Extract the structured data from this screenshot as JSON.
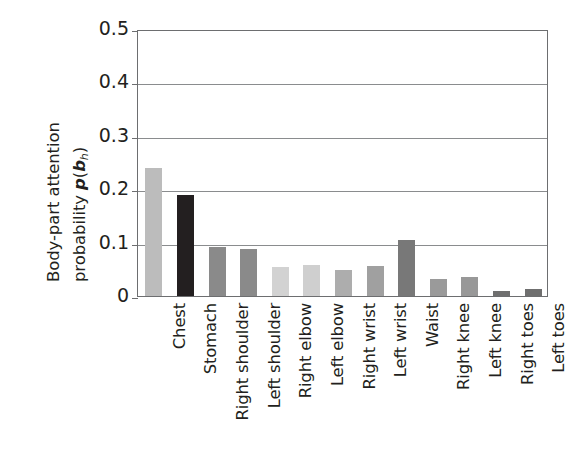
{
  "chart_data": {
    "type": "bar",
    "title": "",
    "xlabel": "",
    "ylabel_line1": "Body-part attention",
    "ylabel_line2_prefix": "probability ",
    "ylabel_line2_symbol": "p",
    "ylabel_line2_open": "(",
    "ylabel_line2_var": "b",
    "ylabel_line2_sub": "h",
    "ylabel_line2_close": ")",
    "ylim": [
      0,
      0.5
    ],
    "yticks": [
      "0",
      "0.1",
      "0.2",
      "0.3",
      "0.4",
      "0.5"
    ],
    "ytick_values": [
      0,
      0.1,
      0.2,
      0.3,
      0.4,
      0.5
    ],
    "grid": "horizontal",
    "legend": "none",
    "categories": [
      "Chest",
      "Stomach",
      "Right shoulder",
      "Left shoulder",
      "Right elbow",
      "Left elbow",
      "Right wrist",
      "Left wrist",
      "Waist",
      "Right knee",
      "Left knee",
      "Right toes",
      "Left toes"
    ],
    "values": [
      0.24,
      0.19,
      0.091,
      0.088,
      0.055,
      0.059,
      0.049,
      0.057,
      0.105,
      0.032,
      0.036,
      0.009,
      0.014
    ],
    "bar_colors": [
      "#bcbcbc",
      "#231f20",
      "#8a8a8a",
      "#8a8a8a",
      "#d2d2d2",
      "#cfcfcf",
      "#adadad",
      "#a0a0a0",
      "#787878",
      "#9a9a9a",
      "#989898",
      "#6f6f6f",
      "#6f6f6f"
    ],
    "axis_color": "#6d6e70",
    "grid_color": "#8a8c8e",
    "text_color": "#231f20"
  }
}
